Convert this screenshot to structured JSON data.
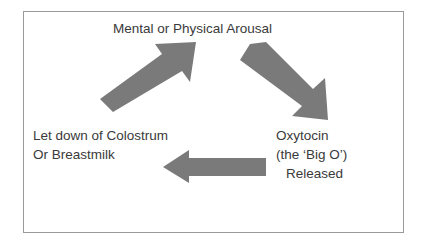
{
  "diagram": {
    "title": "Mental or Physical Arousal",
    "frame_color": "#9a9a9a",
    "background_color": "#ffffff",
    "text_color": "#3a3a3a",
    "arrow_color": "#7a7a7a",
    "nodes": {
      "top": {
        "label": "Mental or Physical Arousal",
        "lines": [
          "Mental or Physical Arousal"
        ]
      },
      "right": {
        "line1": "Oxytocin",
        "line2": "(the ‘Big O’)",
        "line3": "Released"
      },
      "left": {
        "line1": "Let down of Colostrum",
        "line2": "Or Breastmilk"
      }
    },
    "arrows": [
      {
        "name": "arrow-up-right",
        "direction": "up-right",
        "from": "left",
        "to": "top"
      },
      {
        "name": "arrow-down-right",
        "direction": "down-right",
        "from": "top",
        "to": "right"
      },
      {
        "name": "arrow-left",
        "direction": "left",
        "from": "right",
        "to": "left"
      }
    ]
  }
}
